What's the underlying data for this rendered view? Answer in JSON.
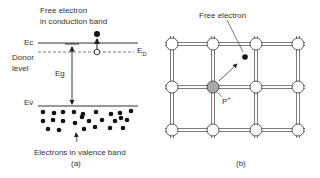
{
  "panel_a": {
    "caption": "(a)",
    "labels": {
      "free_electron_line1": "Free electron",
      "free_electron_line2": "in conduction band",
      "ec": "Ec",
      "ed": "E",
      "ed_sub": "D",
      "donor_line1": "Donor",
      "donor_line2": "level",
      "eg": "Eg",
      "ev": "Ev",
      "valence": "Electrons in valence band"
    }
  },
  "panel_b": {
    "caption": "(b)",
    "labels": {
      "free_electron": "Free electron",
      "p_plus": "P",
      "p_plus_sup": "+"
    },
    "lattice": {
      "columns_x": [
        172,
        213,
        256,
        298
      ],
      "rows_y": [
        44,
        87,
        130
      ],
      "donor_atom": {
        "col": 1,
        "row": 1
      }
    }
  },
  "colors": {
    "line": "#333333",
    "electron": "#111111",
    "atom_fill": "#ffffff",
    "donor_fill": "#aaaaaa"
  }
}
